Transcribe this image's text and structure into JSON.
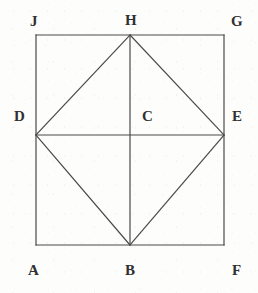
{
  "figure": {
    "type": "geometry-diagram",
    "canvas": {
      "width": 258,
      "height": 293,
      "background": "#fdfdfc"
    },
    "style": {
      "stroke_color": "#4a4a4a",
      "stroke_width": 1.2,
      "label_color": "#303030",
      "label_font_size": 15
    },
    "points": {
      "A": {
        "x": 36,
        "y": 245
      },
      "B": {
        "x": 130,
        "y": 245
      },
      "C": {
        "x": 130,
        "y": 135
      },
      "D": {
        "x": 36,
        "y": 135
      },
      "E": {
        "x": 224,
        "y": 135
      },
      "F": {
        "x": 224,
        "y": 245
      },
      "G": {
        "x": 224,
        "y": 35
      },
      "H": {
        "x": 130,
        "y": 35
      },
      "J": {
        "x": 36,
        "y": 35
      }
    },
    "segments": [
      {
        "name": "square-side-top",
        "from": "J",
        "to": "G"
      },
      {
        "name": "square-side-right",
        "from": "G",
        "to": "F"
      },
      {
        "name": "square-side-bottom",
        "from": "F",
        "to": "A"
      },
      {
        "name": "square-side-left",
        "from": "A",
        "to": "J"
      },
      {
        "name": "rhombus-side-DH",
        "from": "D",
        "to": "H"
      },
      {
        "name": "rhombus-side-HE",
        "from": "H",
        "to": "E"
      },
      {
        "name": "rhombus-side-EB",
        "from": "E",
        "to": "B"
      },
      {
        "name": "rhombus-side-BD",
        "from": "B",
        "to": "D"
      },
      {
        "name": "diagonal-DE",
        "from": "D",
        "to": "E"
      },
      {
        "name": "diagonal-HB",
        "from": "H",
        "to": "B"
      }
    ],
    "labels": [
      {
        "id": "J",
        "text": "J",
        "x": 30,
        "y": 14,
        "anchor": "top-left",
        "inside": false
      },
      {
        "id": "H",
        "text": "H",
        "x": 125,
        "y": 13,
        "anchor": "top-center",
        "inside": false
      },
      {
        "id": "G",
        "text": "G",
        "x": 231,
        "y": 14,
        "anchor": "top-right",
        "inside": false
      },
      {
        "id": "D",
        "text": "D",
        "x": 14,
        "y": 109,
        "anchor": "left",
        "inside": false
      },
      {
        "id": "C",
        "text": "C",
        "x": 142,
        "y": 109,
        "anchor": "centre",
        "inside": true
      },
      {
        "id": "E",
        "text": "E",
        "x": 232,
        "y": 109,
        "anchor": "right",
        "inside": false
      },
      {
        "id": "A",
        "text": "A",
        "x": 28,
        "y": 263,
        "anchor": "bottom-left",
        "inside": false
      },
      {
        "id": "B",
        "text": "B",
        "x": 125,
        "y": 263,
        "anchor": "bottom-center",
        "inside": false
      },
      {
        "id": "F",
        "text": "F",
        "x": 232,
        "y": 263,
        "anchor": "bottom-right",
        "inside": false
      }
    ]
  }
}
